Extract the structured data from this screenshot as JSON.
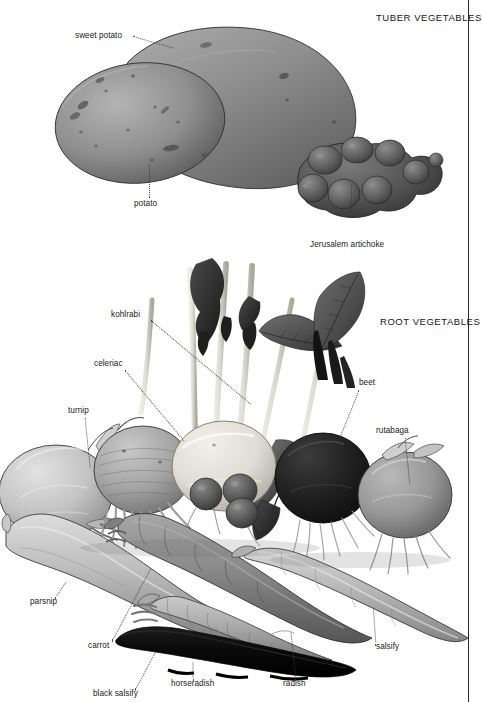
{
  "plate": {
    "kind": "botanical-illustration",
    "medium": "grayscale encyclopedia plate",
    "background_color": "#ffffff",
    "rule_color": "#2a2a2a",
    "sections": [
      {
        "id": "tuber",
        "title": "TUBER VEGETABLES"
      },
      {
        "id": "root",
        "title": "ROOT VEGETABLES"
      }
    ]
  },
  "labels": {
    "sweet_potato": "sweet potato",
    "potato": "potato",
    "jerusalem_artichoke": "Jerusalem artichoke",
    "kohlrabi": "kohlrabi",
    "celeriac": "celeriac",
    "turnip": "turnip",
    "beet": "beet",
    "rutabaga": "rutabaga",
    "parsnip": "parsnip",
    "carrot": "carrot",
    "salsify": "salsify",
    "black_salsify": "black salsify",
    "horseradish": "horseradish",
    "radish": "radish"
  }
}
